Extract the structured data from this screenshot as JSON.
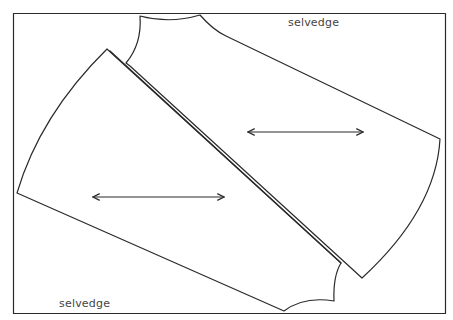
{
  "diagram": {
    "type": "sewing-pattern-layout",
    "labels": {
      "top_selvedge": "selvedge",
      "bottom_selvedge": "selvedge"
    },
    "colors": {
      "line": "#2a2a2a",
      "text": "#444444",
      "background": "#ffffff"
    },
    "pieces": [
      {
        "name": "pattern-piece-left",
        "grainline": "double-headed-arrow"
      },
      {
        "name": "pattern-piece-right",
        "grainline": "double-headed-arrow"
      }
    ]
  }
}
